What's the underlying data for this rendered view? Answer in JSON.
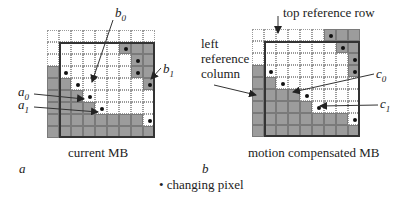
{
  "panels": [
    {
      "id": "a",
      "letter": "a",
      "caption": "current MB",
      "grid_rows": [
        "000000000",
        "000000111",
        "000000011",
        "100000011",
        "110000001",
        "111000000",
        "111100000",
        "111111110",
        "111111111"
      ],
      "dots": [
        [
          1,
          6
        ],
        [
          2,
          7
        ],
        [
          3,
          1
        ],
        [
          3,
          7
        ],
        [
          4,
          2
        ],
        [
          4,
          8
        ],
        [
          5,
          3
        ],
        [
          6,
          4
        ],
        [
          7,
          8
        ]
      ],
      "labels": {
        "b0": "b",
        "b0_sub": "0",
        "b1": "b",
        "b1_sub": "1",
        "a0": "a",
        "a0_sub": "0",
        "a1": "a",
        "a1_sub": "1"
      }
    },
    {
      "id": "b",
      "letter": "b",
      "caption": "motion compensated MB",
      "grid_rows": [
        "000000111",
        "000000011",
        "000000001",
        "100000001",
        "110000000",
        "111100000",
        "111110000",
        "111111110",
        "111111111"
      ],
      "dots": [
        [
          0,
          6
        ],
        [
          1,
          7
        ],
        [
          2,
          8
        ],
        [
          3,
          1
        ],
        [
          3,
          8
        ],
        [
          4,
          2
        ],
        [
          5,
          4
        ],
        [
          6,
          5
        ],
        [
          7,
          8
        ]
      ],
      "labels": {
        "top_ref": "top reference row",
        "left_ref_1": "left",
        "left_ref_2": "reference",
        "left_ref_3": "column",
        "c0": "c",
        "c0_sub": "0",
        "c1": "c",
        "c1_sub": "1"
      }
    }
  ],
  "legend": {
    "symbol": "•",
    "text": "changing pixel"
  },
  "colors": {
    "shaded": "#9c9c9c",
    "border": "#333333",
    "dot": "#111111"
  }
}
